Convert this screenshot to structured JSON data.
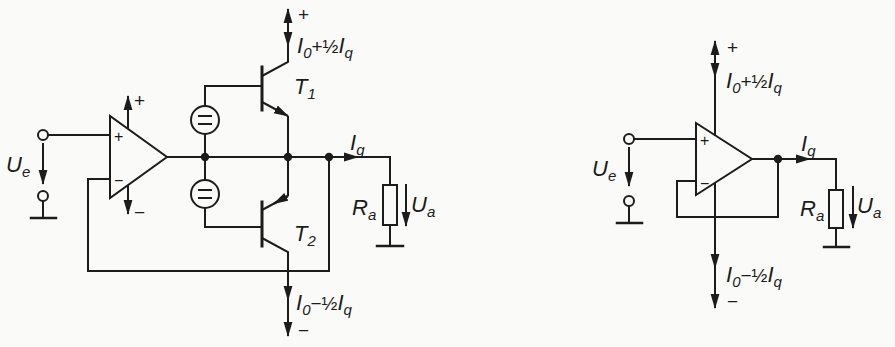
{
  "colors": {
    "ink": "#1c1c1c",
    "background": "#fafaf8"
  },
  "left": {
    "input_voltage": [
      "U",
      "e"
    ],
    "supply_plus": "+",
    "current_top": [
      "I",
      "0",
      "+",
      "½",
      "I",
      "q"
    ],
    "transistor_top": [
      "T",
      "1"
    ],
    "transistor_bottom": [
      "T",
      "2"
    ],
    "output_current": [
      "I",
      "q"
    ],
    "load_resistor": [
      "R",
      "a"
    ],
    "output_voltage": [
      "U",
      "a"
    ],
    "current_bottom": [
      "I",
      "0",
      "−",
      "½",
      "I",
      "q"
    ],
    "supply_minus": "−",
    "opamp": {
      "noninv": "+",
      "inv": "−",
      "vplus": "+",
      "vminus": "−"
    }
  },
  "right": {
    "input_voltage": [
      "U",
      "e"
    ],
    "supply_plus": "+",
    "current_top": [
      "I",
      "0",
      "+",
      "½",
      "I",
      "q"
    ],
    "output_current": [
      "I",
      "q"
    ],
    "load_resistor": [
      "R",
      "a"
    ],
    "output_voltage": [
      "U",
      "a"
    ],
    "current_bottom": [
      "I",
      "0",
      "−",
      "½",
      "I",
      "q"
    ],
    "supply_minus": "−",
    "opamp": {
      "noninv": "+",
      "inv": "−"
    }
  }
}
